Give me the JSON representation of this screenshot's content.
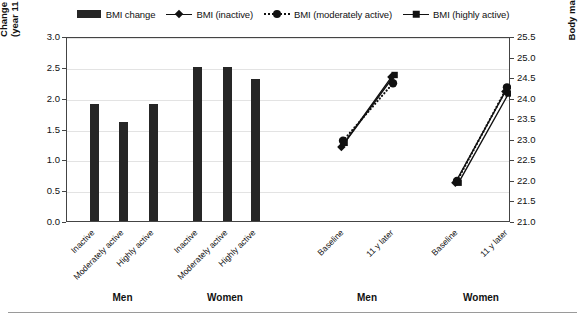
{
  "legend": {
    "items": [
      {
        "label": "BMI change",
        "key": "bar-swatch"
      },
      {
        "label": "BMI (inactive)",
        "key": "solid-line-diamond"
      },
      {
        "label": "BMI (moderately active)",
        "key": "dotted-line-circle"
      },
      {
        "label": "BMI (highly active)",
        "key": "solid-line-square"
      }
    ]
  },
  "axes": {
    "left": {
      "title_line1": "Change in BMI (Δ kg/m²)",
      "title_line2": "(year 11 minus baseline)",
      "ticks": [
        "0.0",
        "0.5",
        "1.0",
        "1.5",
        "2.0",
        "2.5",
        "3.0"
      ],
      "min": 0.0,
      "max": 3.0,
      "step": 0.5
    },
    "right": {
      "title": "Body mass index (BMI) (kg/m²)",
      "ticks": [
        "21.0",
        "21.5",
        "22.0",
        "22.5",
        "23.0",
        "23.5",
        "24.0",
        "24.5",
        "25.0",
        "25.5"
      ],
      "min": 21.0,
      "max": 25.5,
      "step": 0.5
    }
  },
  "group_labels": [
    "Men",
    "Women",
    "Men",
    "Women"
  ],
  "category_labels": [
    "Inactive",
    "Moderately active",
    "Highly active",
    "Inactive",
    "Moderately active",
    "Highly active",
    "Baseline",
    "11 y later",
    "Baseline",
    "11 y later"
  ],
  "colors": {
    "bar": "#262626",
    "line": "#111111",
    "grid": "#e3e3e3",
    "frame": "#444444",
    "text": "#111111"
  },
  "chart_data": {
    "type": "bar",
    "title": "",
    "xlabel": "",
    "ylabel": "Change in BMI (Δ kg/m²) (year 11 minus baseline)",
    "y2label": "Body mass index (BMI) (kg/m²)",
    "ylim": [
      0.0,
      3.0
    ],
    "y2lim": [
      21.0,
      25.5
    ],
    "grid": true,
    "legend_position": "top-center",
    "bars": {
      "axis": "left",
      "series_name": "BMI change",
      "groups": [
        {
          "group": "Men",
          "categories": [
            "Inactive",
            "Moderately active",
            "Highly active"
          ],
          "values": [
            1.9,
            1.6,
            1.9
          ]
        },
        {
          "group": "Women",
          "categories": [
            "Inactive",
            "Moderately active",
            "Highly active"
          ],
          "values": [
            2.5,
            2.5,
            2.3
          ]
        }
      ]
    },
    "lines": {
      "axis": "right",
      "x": [
        "Baseline",
        "11 y later"
      ],
      "panels": [
        {
          "group": "Men",
          "series": [
            {
              "name": "BMI (inactive)",
              "marker": "diamond",
              "linestyle": "solid",
              "values": [
                22.85,
                24.55
              ]
            },
            {
              "name": "BMI (moderately active)",
              "marker": "circle",
              "linestyle": "dotted",
              "values": [
                23.0,
                24.4
              ]
            },
            {
              "name": "BMI (highly active)",
              "marker": "square",
              "linestyle": "solid",
              "values": [
                22.95,
                24.6
              ]
            }
          ]
        },
        {
          "group": "Women",
          "series": [
            {
              "name": "BMI (inactive)",
              "marker": "diamond",
              "linestyle": "solid",
              "values": [
                21.98,
                24.2
              ]
            },
            {
              "name": "BMI (moderately active)",
              "marker": "circle",
              "linestyle": "dotted",
              "values": [
                22.02,
                24.3
              ]
            },
            {
              "name": "BMI (highly active)",
              "marker": "square",
              "linestyle": "solid",
              "values": [
                21.98,
                24.15
              ]
            }
          ]
        }
      ]
    }
  }
}
